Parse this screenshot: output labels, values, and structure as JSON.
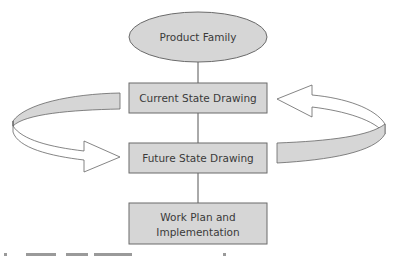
{
  "diagram": {
    "type": "flowchart",
    "colors": {
      "node_fill": "#d6d6d6",
      "node_stroke": "#6b6b6b",
      "text": "#3a3a3a",
      "connector": "#555555",
      "arrow_gray_band": "#d6d6d6",
      "arrow_white_band": "#ffffff",
      "background": "#ffffff"
    },
    "nodes": [
      {
        "id": "product-family",
        "shape": "ellipse",
        "label": "Product Family"
      },
      {
        "id": "current-state",
        "shape": "rect",
        "label": "Current State Drawing"
      },
      {
        "id": "future-state",
        "shape": "rect",
        "label": "Future State Drawing"
      },
      {
        "id": "work-plan",
        "shape": "rect",
        "label_line1": "Work Plan and",
        "label_line2": "Implementation"
      }
    ],
    "edges": [
      {
        "from": "product-family",
        "to": "current-state",
        "style": "line"
      },
      {
        "from": "current-state",
        "to": "future-state",
        "style": "line"
      },
      {
        "from": "future-state",
        "to": "work-plan",
        "style": "line"
      },
      {
        "from": "current-state",
        "to": "future-state",
        "style": "curved-arrow",
        "side": "left"
      },
      {
        "from": "future-state",
        "to": "current-state",
        "style": "curved-arrow",
        "side": "right"
      }
    ]
  }
}
